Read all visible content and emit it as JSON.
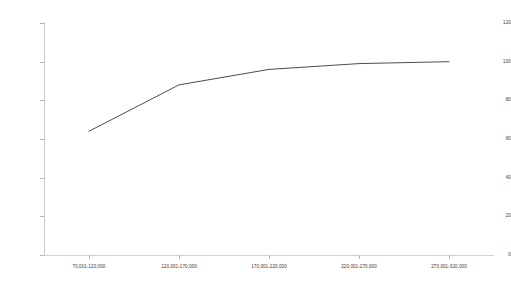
{
  "chart_data": {
    "type": "line",
    "title": "",
    "subtitle": "",
    "xlabel": "",
    "ylabel": "",
    "categories": [
      "70,001-120,000",
      "120,001-170,000",
      "170,001-220,000",
      "220,001-270,000",
      "270,001-320,000"
    ],
    "values": [
      64,
      88,
      96,
      99,
      100
    ],
    "series": [
      {
        "name": "",
        "values": [
          64,
          88,
          96,
          99,
          100
        ]
      }
    ],
    "ylim": [
      0,
      120
    ],
    "yticks": [
      0,
      20,
      40,
      60,
      80,
      100,
      120
    ],
    "ytick_labels": [
      "0",
      "20",
      "40",
      "60",
      "80",
      "100",
      "120"
    ],
    "grid": false,
    "legend": "none",
    "line_color": "#4d4d4d",
    "axis_color": "#c8c8c8",
    "tick_label_color": "#3a3a3a",
    "background_color": "#ffffff",
    "annotations": []
  }
}
